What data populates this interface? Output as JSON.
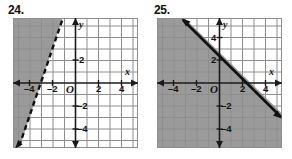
{
  "page": {
    "background": "#ffffff",
    "width": 292,
    "height": 159
  },
  "colors": {
    "grid_line": "#8e8e8e",
    "grid_bg": "#ffffff",
    "shade_fill": "#9a9a9a",
    "axis": "#1a1a1a",
    "boundary": "#111111",
    "text": "#111111"
  },
  "problems": [
    {
      "number": "24.",
      "graph": {
        "name": "inequality-graph-24",
        "x_axis_label": "x",
        "y_axis_label": "y",
        "origin_label": "O",
        "x_ticks": [
          {
            "value": -4,
            "label": "–4"
          },
          {
            "value": -2,
            "label": "–2"
          },
          {
            "value": 2,
            "label": "2"
          },
          {
            "value": 4,
            "label": "4"
          }
        ],
        "y_ticks": [
          {
            "value": 2,
            "label": "2"
          },
          {
            "value": -2,
            "label": "–2"
          },
          {
            "value": -4,
            "label": "–4"
          }
        ],
        "x_range": [
          -5.5,
          5.5
        ],
        "y_range": [
          -5.5,
          5.5
        ],
        "grid": "on",
        "boundary": {
          "style": "dashed",
          "slope": 3,
          "y_intercept": 9,
          "x_intercept": -3,
          "through_points": [
            [
              -3,
              0
            ],
            [
              -2,
              3
            ]
          ],
          "arrow_ends": "both"
        },
        "shading": "upper-left"
      }
    },
    {
      "number": "25.",
      "graph": {
        "name": "inequality-graph-25",
        "x_axis_label": "x",
        "y_axis_label": "y",
        "origin_label": "O",
        "x_ticks": [
          {
            "value": -4,
            "label": "–4"
          },
          {
            "value": -2,
            "label": "–2"
          },
          {
            "value": 2,
            "label": "2"
          },
          {
            "value": 4,
            "label": "4"
          }
        ],
        "y_ticks": [
          {
            "value": 4,
            "label": "4"
          },
          {
            "value": 2,
            "label": "2"
          },
          {
            "value": -2,
            "label": "–2"
          },
          {
            "value": -4,
            "label": "–4"
          }
        ],
        "x_range": [
          -5.5,
          5.5
        ],
        "y_range": [
          -5.5,
          5.5
        ],
        "grid": "on",
        "boundary": {
          "style": "solid",
          "slope": -1,
          "y_intercept": 3,
          "x_intercept": 3,
          "through_points": [
            [
              0,
              3
            ],
            [
              3,
              0
            ]
          ],
          "arrow_ends": "both"
        },
        "shading": "lower-left"
      }
    }
  ]
}
